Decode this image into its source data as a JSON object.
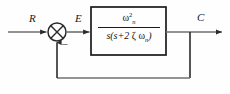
{
  "diagram": {
    "type": "control-system-block-diagram",
    "colors": {
      "line": "#2b2b2b",
      "block_border": "#1a1a1a",
      "background": "#fefefe",
      "text": "#111111"
    },
    "signals": {
      "input_label": "R",
      "error_label": "E",
      "output_label": "C",
      "feedback_sign": "–"
    },
    "summing_junction": {
      "name": "summing-junction",
      "style": "crossed-circle",
      "center_x": 57,
      "center_y": 32,
      "radius": 9
    },
    "transfer_function_block": {
      "name": "transfer-function-block",
      "numerator": {
        "base": "ω",
        "superscript": "2",
        "subscript": "n",
        "text": "ω²ₙ"
      },
      "denominator": {
        "text": "s(s+2 ζ ωₙ)",
        "parts": {
          "lead": "s(s+2 ",
          "zeta": "ζ",
          "space": " ",
          "omega": "ω",
          "subscript": "n",
          "close": ")"
        }
      },
      "full_text": "ω²ₙ / s(s+2 ζ ωₙ)",
      "x": 91,
      "y": 7,
      "width": 75,
      "height": 48
    },
    "feedback_path": {
      "name": "feedback-path",
      "gain": "unity",
      "takeoff_x": 190,
      "bottom_y": 78
    }
  }
}
